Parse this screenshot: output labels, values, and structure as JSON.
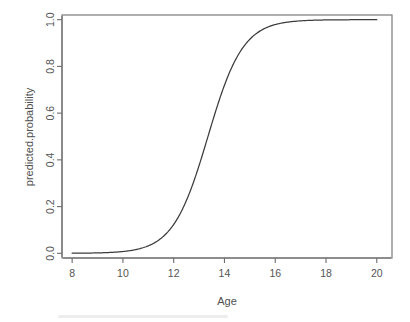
{
  "chart_data": {
    "type": "line",
    "title": "",
    "subtitle": "",
    "xlabel": "Age",
    "ylabel": "predicted.probability",
    "xlim": [
      7.6,
      20.6
    ],
    "ylim": [
      -0.02,
      1.02
    ],
    "xticks": [
      8,
      10,
      12,
      14,
      16,
      18,
      20
    ],
    "xtick_labels": [
      "8",
      "10",
      "12",
      "14",
      "16",
      "18",
      "20"
    ],
    "yticks": [
      0.0,
      0.2,
      0.4,
      0.6,
      0.8,
      1.0
    ],
    "ytick_labels": [
      "0.0",
      "0.2",
      "0.4",
      "0.6",
      "0.8",
      "1.0"
    ],
    "grid": false,
    "legend": null,
    "annotations": [],
    "line_color": "#3c3c3c",
    "axis_color": "#7a7a7a",
    "background": "#ffffff",
    "series": [
      {
        "name": "predicted.probability",
        "model": "logistic",
        "midpoint_age": 13.35,
        "slope": 1.45,
        "x": [
          8.0,
          8.5,
          9.0,
          9.5,
          10.0,
          10.5,
          11.0,
          11.5,
          12.0,
          12.25,
          12.5,
          12.75,
          13.0,
          13.25,
          13.5,
          13.75,
          14.0,
          14.25,
          14.5,
          14.75,
          15.0,
          15.5,
          16.0,
          16.5,
          17.0,
          17.5,
          18.0,
          18.5,
          19.0,
          19.5,
          20.0
        ],
        "values": [
          0.005,
          0.011,
          0.022,
          0.044,
          0.087,
          0.124,
          0.16,
          0.25,
          0.34,
          0.4,
          0.46,
          0.53,
          0.6,
          0.67,
          0.74,
          0.8,
          0.85,
          0.89,
          0.92,
          0.94,
          0.955,
          0.975,
          0.986,
          0.992,
          0.995,
          0.997,
          0.998,
          0.999,
          0.999,
          1.0,
          1.0
        ]
      }
    ]
  },
  "figure": {
    "plot_box": {
      "left_px": 62,
      "top_px": 15,
      "right_px": 392,
      "bottom_px": 258
    }
  }
}
